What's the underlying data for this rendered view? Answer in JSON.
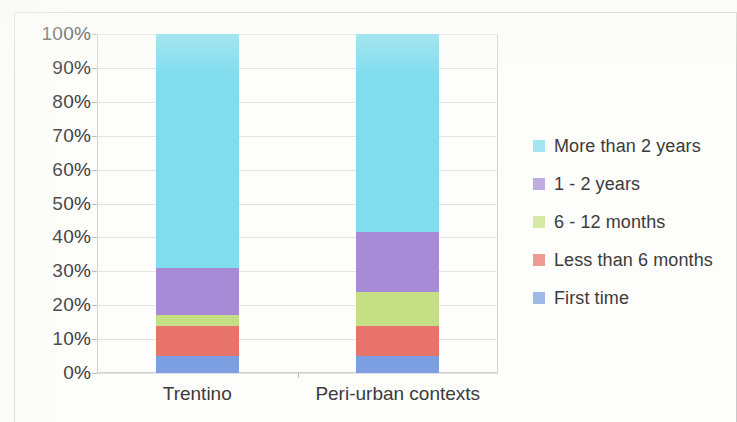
{
  "chart_data": {
    "type": "bar",
    "stacked": true,
    "normalized": "100%",
    "title": "",
    "subtitle": "",
    "xlabel": "",
    "ylabel": "",
    "categories": [
      "Trentino",
      "Peri-urban contexts"
    ],
    "ylim": [
      0,
      100
    ],
    "ytick_labels": [
      "100%",
      "90%",
      "80%",
      "70%",
      "60%",
      "50%",
      "40%",
      "30%",
      "20%",
      "10%",
      "0%"
    ],
    "ytick_values": [
      100,
      90,
      80,
      70,
      60,
      50,
      40,
      30,
      20,
      10,
      0
    ],
    "grid": true,
    "legend_position": "right",
    "series": [
      {
        "name": "More than 2 years",
        "color": "#7FDDEE",
        "values": [
          69.0,
          58.5
        ],
        "cumulative_bottom": [
          31.0,
          41.5
        ],
        "cumulative_top": [
          100.0,
          100.0
        ]
      },
      {
        "name": "1 - 2 years",
        "color": "#A78BD6",
        "values": [
          14.0,
          17.5
        ],
        "cumulative_bottom": [
          17.0,
          24.0
        ],
        "cumulative_top": [
          31.0,
          41.5
        ]
      },
      {
        "name": "6 - 12 months",
        "color": "#C5E084",
        "values": [
          3.0,
          10.0
        ],
        "cumulative_bottom": [
          14.0,
          14.0
        ],
        "cumulative_top": [
          17.0,
          24.0
        ]
      },
      {
        "name": "Less than 6 months",
        "color": "#E8736A",
        "values": [
          9.0,
          9.0
        ],
        "cumulative_bottom": [
          5.0,
          5.0
        ],
        "cumulative_top": [
          14.0,
          14.0
        ]
      },
      {
        "name": "First time",
        "color": "#7B9FE0",
        "values": [
          5.0,
          5.0
        ],
        "cumulative_bottom": [
          0.0,
          0.0
        ],
        "cumulative_top": [
          5.0,
          5.0
        ]
      }
    ]
  },
  "legend": {
    "entries": [
      {
        "label": "More than 2 years",
        "color": "#7FDDEE"
      },
      {
        "label": "1 - 2 years",
        "color": "#A78BD6"
      },
      {
        "label": "6 - 12 months",
        "color": "#C5E084"
      },
      {
        "label": "Less than 6 months",
        "color": "#E8736A"
      },
      {
        "label": "First time",
        "color": "#7B9FE0"
      }
    ]
  }
}
